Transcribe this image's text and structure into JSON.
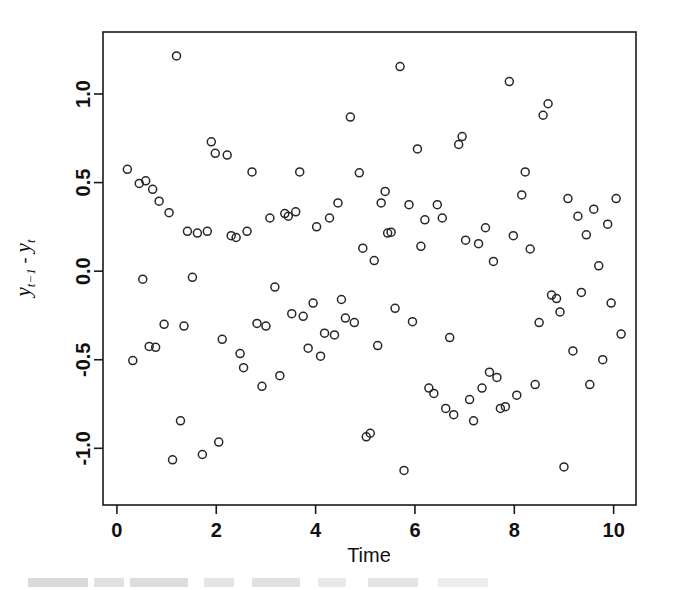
{
  "figure": {
    "background_color": "#ffffff",
    "foreground_color": "#111111",
    "point_stroke_color": "#262626",
    "caption_partial": ""
  },
  "chart_data": {
    "type": "scatter",
    "title": "",
    "subtitle": "",
    "xlabel": "Time",
    "ylabel": "y_{t-1} - y_t",
    "ylabel_parts": {
      "var1": "y",
      "var1_sub": "t−1",
      "operator": "-",
      "var2": "y",
      "var2_sub": "t"
    },
    "xlim": [
      -0.28,
      10.45
    ],
    "ylim": [
      -1.32,
      1.35
    ],
    "xticks": [
      0,
      2,
      4,
      6,
      8,
      10
    ],
    "xticklabels": [
      "0",
      "2",
      "4",
      "6",
      "8",
      "10"
    ],
    "yticks": [
      -1.0,
      -0.5,
      0.0,
      0.5,
      1.0
    ],
    "yticklabels": [
      "-1.0",
      "-0.5",
      "0.0",
      "0.5",
      "1.0"
    ],
    "grid": false,
    "legend": null,
    "marker": "open-circle",
    "marker_size": 4,
    "n_points": 120,
    "x": [
      0.21,
      0.32,
      0.45,
      0.52,
      0.58,
      0.65,
      0.72,
      0.78,
      0.85,
      0.95,
      1.05,
      1.12,
      1.2,
      1.28,
      1.35,
      1.42,
      1.52,
      1.62,
      1.72,
      1.82,
      1.9,
      1.98,
      2.05,
      2.12,
      2.22,
      2.3,
      2.4,
      2.48,
      2.55,
      2.62,
      2.72,
      2.82,
      2.92,
      3.0,
      3.08,
      3.18,
      3.28,
      3.38,
      3.45,
      3.52,
      3.6,
      3.68,
      3.75,
      3.85,
      3.95,
      4.02,
      4.1,
      4.18,
      4.28,
      4.38,
      4.45,
      4.52,
      4.6,
      4.7,
      4.78,
      4.88,
      4.95,
      5.02,
      5.1,
      5.18,
      5.25,
      5.32,
      5.4,
      5.45,
      5.52,
      5.6,
      5.7,
      5.78,
      5.88,
      5.95,
      6.05,
      6.12,
      6.2,
      6.28,
      6.38,
      6.45,
      6.55,
      6.62,
      6.7,
      6.78,
      6.88,
      6.95,
      7.02,
      7.1,
      7.18,
      7.28,
      7.35,
      7.42,
      7.5,
      7.58,
      7.65,
      7.72,
      7.82,
      7.9,
      7.98,
      8.05,
      8.15,
      8.22,
      8.32,
      8.42,
      8.5,
      8.58,
      8.68,
      8.75,
      8.85,
      8.92,
      9.0,
      9.08,
      9.18,
      9.28,
      9.35,
      9.45,
      9.52,
      9.6,
      9.7,
      9.78,
      9.88,
      9.95,
      10.05,
      10.15
    ],
    "y": [
      0.575,
      -0.505,
      0.495,
      -0.045,
      0.51,
      -0.425,
      0.462,
      -0.43,
      0.395,
      -0.3,
      0.33,
      -1.065,
      1.215,
      -0.845,
      -0.31,
      0.225,
      -0.035,
      0.215,
      -1.035,
      0.225,
      0.73,
      0.665,
      -0.965,
      -0.385,
      0.655,
      0.2,
      0.19,
      -0.465,
      -0.545,
      0.225,
      0.56,
      -0.295,
      -0.65,
      -0.31,
      0.3,
      -0.09,
      -0.59,
      0.325,
      0.31,
      -0.24,
      0.335,
      0.56,
      -0.255,
      -0.435,
      -0.18,
      0.25,
      -0.48,
      -0.35,
      0.3,
      -0.36,
      0.385,
      -0.16,
      -0.265,
      0.87,
      -0.29,
      0.555,
      0.13,
      -0.935,
      -0.915,
      0.06,
      -0.42,
      0.385,
      0.45,
      0.215,
      0.22,
      -0.21,
      1.155,
      -1.125,
      0.375,
      -0.285,
      0.69,
      0.14,
      0.29,
      -0.66,
      -0.69,
      0.375,
      0.3,
      -0.775,
      -0.375,
      -0.81,
      0.715,
      0.76,
      0.175,
      -0.725,
      -0.845,
      0.155,
      -0.66,
      0.245,
      -0.57,
      0.055,
      -0.6,
      -0.775,
      -0.765,
      1.07,
      0.2,
      -0.7,
      0.43,
      0.56,
      0.125,
      -0.64,
      -0.29,
      0.88,
      0.945,
      -0.135,
      -0.155,
      -0.23,
      -1.105,
      0.41,
      -0.45,
      0.31,
      -0.12,
      0.205,
      -0.64,
      0.35,
      0.03,
      -0.5,
      0.265,
      -0.18,
      0.41,
      -0.355
    ]
  },
  "axes": {
    "x_axis_name": "time-axis",
    "y_axis_name": "difference-axis"
  }
}
